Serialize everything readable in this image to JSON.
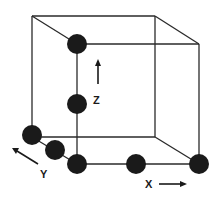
{
  "diagram": {
    "type": "crystal-lattice-cube",
    "axes": {
      "x": {
        "label": "X"
      },
      "y": {
        "label": "Y"
      },
      "z": {
        "label": "Z"
      }
    },
    "atoms": [
      {
        "id": "atom-top-front-left",
        "x": 77,
        "y": 44
      },
      {
        "id": "atom-mid-front-left",
        "x": 77,
        "y": 104
      },
      {
        "id": "atom-bottom-back-left",
        "x": 32,
        "y": 135
      },
      {
        "id": "atom-bottom-mid-left-edge",
        "x": 55,
        "y": 150
      },
      {
        "id": "atom-bottom-front-left",
        "x": 77,
        "y": 164
      },
      {
        "id": "atom-bottom-mid-front-edge",
        "x": 136,
        "y": 164
      },
      {
        "id": "atom-bottom-front-right",
        "x": 199,
        "y": 164
      }
    ],
    "colors": {
      "atom": "#1a1a1a",
      "edge": "#2a2a2a",
      "background": "#ffffff"
    }
  }
}
